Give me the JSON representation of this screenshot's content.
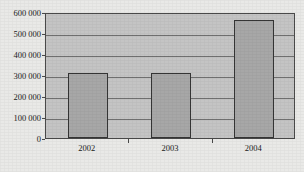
{
  "chart_data": {
    "type": "bar",
    "title": "",
    "title_note": "title row is cropped off the top edge of the screenshot and is illegible",
    "xlabel": "",
    "ylabel": "",
    "categories": [
      "2002",
      "2003",
      "2004"
    ],
    "values": [
      310000,
      310000,
      562000
    ],
    "series": [
      {
        "name": "",
        "values": [
          310000,
          310000,
          562000
        ]
      }
    ],
    "ylim": [
      0,
      600000
    ],
    "y_ticks": [
      0,
      100000,
      200000,
      300000,
      400000,
      500000,
      600000
    ],
    "y_tick_labels": [
      "0",
      "100 000",
      "200 000",
      "300 000",
      "400 000",
      "500 000",
      "600 000"
    ],
    "grid": true,
    "grid_axis": "y",
    "legend": false,
    "legend_position": "none",
    "thousands_separator": "space",
    "bar_count": 3
  },
  "axes": {
    "y": {
      "labels": [
        {
          "value": 600000,
          "text": "600 000"
        },
        {
          "value": 500000,
          "text": "500 000"
        },
        {
          "value": 400000,
          "text": "400 000"
        },
        {
          "value": 300000,
          "text": "300 000"
        },
        {
          "value": 200000,
          "text": "200 000"
        },
        {
          "value": 100000,
          "text": "100 000"
        },
        {
          "value": 0,
          "text": "0"
        }
      ]
    },
    "x": {
      "labels": [
        {
          "text": "2002"
        },
        {
          "text": "2003"
        },
        {
          "text": "2004"
        }
      ]
    }
  },
  "colors": {
    "page_background": "#e9e9e7",
    "plot_background": "#c4c4c4",
    "bar_fill": "#a7a7a7",
    "bar_border": "#353535",
    "gridline": "#6f6f6f",
    "axis": "#4a4a4a",
    "text": "#1b1b1b"
  }
}
